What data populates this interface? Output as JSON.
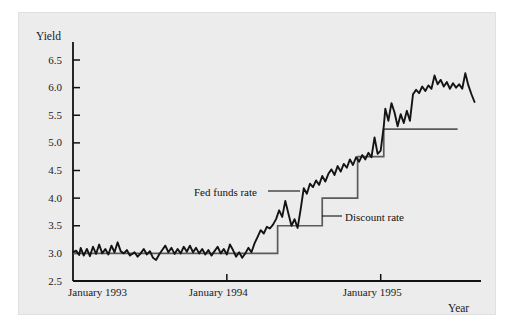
{
  "figure": {
    "background_color": "#ececed",
    "page_color": "#ffffff"
  },
  "chart_data": {
    "type": "line",
    "title": "",
    "xlabel": "Year",
    "ylabel": "Yield",
    "grid": false,
    "legend_position": "inline-annotations",
    "xlim": [
      1993.0,
      1995.6
    ],
    "ylim": [
      2.5,
      6.5
    ],
    "ytick_labels": [
      "2.5",
      "3.0",
      "3.5",
      "4.0",
      "4.5",
      "5.0",
      "5.5",
      "6.0",
      "6.5"
    ],
    "ytick_values": [
      2.5,
      3.0,
      3.5,
      4.0,
      4.5,
      5.0,
      5.5,
      6.0,
      6.5
    ],
    "xtick_labels": [
      "January 1993",
      "January 1994",
      "January 1995"
    ],
    "xtick_values": [
      1993.0,
      1994.0,
      1995.0
    ],
    "series": [
      {
        "name": "Fed funds rate",
        "color": "#111111",
        "width": 2.0,
        "annotation": "Fed funds rate",
        "points": [
          [
            1993.0,
            3.02
          ],
          [
            1993.02,
            3.05
          ],
          [
            1993.04,
            2.97
          ],
          [
            1993.05,
            3.1
          ],
          [
            1993.07,
            2.96
          ],
          [
            1993.09,
            3.08
          ],
          [
            1993.11,
            2.95
          ],
          [
            1993.13,
            3.12
          ],
          [
            1993.15,
            2.99
          ],
          [
            1993.17,
            3.16
          ],
          [
            1993.19,
            3.0
          ],
          [
            1993.21,
            3.08
          ],
          [
            1993.23,
            2.98
          ],
          [
            1993.25,
            3.14
          ],
          [
            1993.27,
            3.02
          ],
          [
            1993.29,
            3.2
          ],
          [
            1993.31,
            3.04
          ],
          [
            1993.33,
            3.0
          ],
          [
            1993.35,
            3.06
          ],
          [
            1993.37,
            2.96
          ],
          [
            1993.4,
            3.02
          ],
          [
            1993.42,
            2.94
          ],
          [
            1993.44,
            3.0
          ],
          [
            1993.46,
            3.08
          ],
          [
            1993.48,
            2.98
          ],
          [
            1993.5,
            3.04
          ],
          [
            1993.52,
            2.92
          ],
          [
            1993.54,
            2.88
          ],
          [
            1993.56,
            2.98
          ],
          [
            1993.58,
            3.06
          ],
          [
            1993.6,
            3.14
          ],
          [
            1993.62,
            3.02
          ],
          [
            1993.64,
            3.1
          ],
          [
            1993.66,
            2.99
          ],
          [
            1993.68,
            3.08
          ],
          [
            1993.7,
            3.0
          ],
          [
            1993.72,
            3.12
          ],
          [
            1993.74,
            3.03
          ],
          [
            1993.76,
            3.14
          ],
          [
            1993.78,
            3.02
          ],
          [
            1993.8,
            3.1
          ],
          [
            1993.82,
            3.0
          ],
          [
            1993.84,
            3.08
          ],
          [
            1993.86,
            2.98
          ],
          [
            1993.88,
            3.06
          ],
          [
            1993.9,
            2.96
          ],
          [
            1993.92,
            3.04
          ],
          [
            1993.94,
            3.12
          ],
          [
            1993.96,
            3.0
          ],
          [
            1993.98,
            3.08
          ],
          [
            1994.0,
            2.98
          ],
          [
            1994.02,
            3.16
          ],
          [
            1994.04,
            3.06
          ],
          [
            1994.06,
            2.94
          ],
          [
            1994.08,
            3.02
          ],
          [
            1994.1,
            2.92
          ],
          [
            1994.12,
            3.0
          ],
          [
            1994.14,
            3.1
          ],
          [
            1994.16,
            3.02
          ],
          [
            1994.18,
            3.18
          ],
          [
            1994.2,
            3.3
          ],
          [
            1994.22,
            3.42
          ],
          [
            1994.24,
            3.36
          ],
          [
            1994.26,
            3.48
          ],
          [
            1994.28,
            3.45
          ],
          [
            1994.3,
            3.52
          ],
          [
            1994.32,
            3.62
          ],
          [
            1994.34,
            3.78
          ],
          [
            1994.36,
            3.66
          ],
          [
            1994.38,
            3.95
          ],
          [
            1994.4,
            3.72
          ],
          [
            1994.42,
            3.5
          ],
          [
            1994.44,
            3.62
          ],
          [
            1994.46,
            3.46
          ],
          [
            1994.48,
            3.8
          ],
          [
            1994.5,
            4.18
          ],
          [
            1994.52,
            4.08
          ],
          [
            1994.54,
            4.26
          ],
          [
            1994.56,
            4.2
          ],
          [
            1994.58,
            4.32
          ],
          [
            1994.6,
            4.24
          ],
          [
            1994.62,
            4.4
          ],
          [
            1994.64,
            4.3
          ],
          [
            1994.66,
            4.44
          ],
          [
            1994.68,
            4.52
          ],
          [
            1994.7,
            4.42
          ],
          [
            1994.72,
            4.58
          ],
          [
            1994.74,
            4.48
          ],
          [
            1994.76,
            4.62
          ],
          [
            1994.78,
            4.55
          ],
          [
            1994.8,
            4.7
          ],
          [
            1994.82,
            4.6
          ],
          [
            1994.84,
            4.74
          ],
          [
            1994.86,
            4.66
          ],
          [
            1994.88,
            4.78
          ],
          [
            1994.9,
            4.7
          ],
          [
            1994.92,
            4.82
          ],
          [
            1994.94,
            4.74
          ],
          [
            1994.96,
            5.1
          ],
          [
            1994.98,
            4.8
          ],
          [
            1995.0,
            4.86
          ],
          [
            1995.02,
            5.3
          ],
          [
            1995.03,
            5.62
          ],
          [
            1995.05,
            5.4
          ],
          [
            1995.07,
            5.72
          ],
          [
            1995.09,
            5.55
          ],
          [
            1995.11,
            5.3
          ],
          [
            1995.13,
            5.52
          ],
          [
            1995.15,
            5.36
          ],
          [
            1995.17,
            5.58
          ],
          [
            1995.19,
            5.4
          ],
          [
            1995.21,
            5.88
          ],
          [
            1995.23,
            5.96
          ],
          [
            1995.25,
            5.9
          ],
          [
            1995.27,
            6.02
          ],
          [
            1995.29,
            5.94
          ],
          [
            1995.31,
            6.04
          ],
          [
            1995.33,
            5.98
          ],
          [
            1995.35,
            6.22
          ],
          [
            1995.37,
            6.06
          ],
          [
            1995.39,
            6.14
          ],
          [
            1995.41,
            6.02
          ],
          [
            1995.43,
            6.1
          ],
          [
            1995.45,
            5.98
          ],
          [
            1995.47,
            6.08
          ],
          [
            1995.49,
            6.0
          ],
          [
            1995.51,
            6.06
          ],
          [
            1995.53,
            5.98
          ],
          [
            1995.55,
            6.26
          ],
          [
            1995.57,
            6.04
          ],
          [
            1995.59,
            5.88
          ],
          [
            1995.61,
            5.74
          ]
        ]
      },
      {
        "name": "Discount rate",
        "color": "#5a5a5a",
        "width": 1.6,
        "annotation": "Discount rate",
        "step_points": [
          [
            1993.0,
            3.0
          ],
          [
            1994.33,
            3.0
          ],
          [
            1994.33,
            3.5
          ],
          [
            1994.62,
            3.5
          ],
          [
            1994.62,
            4.0
          ],
          [
            1994.85,
            4.0
          ],
          [
            1994.85,
            4.75
          ],
          [
            1995.02,
            4.75
          ],
          [
            1995.02,
            5.25
          ],
          [
            1995.5,
            5.25
          ]
        ]
      }
    ],
    "annotations": [
      {
        "text": "Fed funds rate",
        "x": 1993.62,
        "y": 4.22
      },
      {
        "text": "Discount rate",
        "x": 1994.92,
        "y": 3.78
      }
    ]
  }
}
